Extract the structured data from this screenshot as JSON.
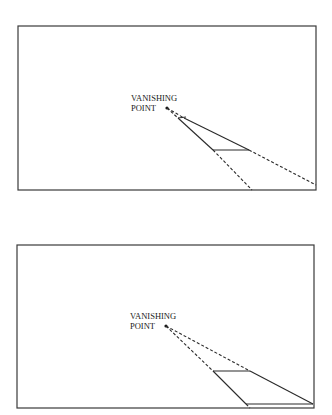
{
  "panels": [
    {
      "label_line1": "VANISHING",
      "label_line2": "POINT"
    },
    {
      "label_line1": "VANISHING",
      "label_line2": "POINT"
    }
  ]
}
